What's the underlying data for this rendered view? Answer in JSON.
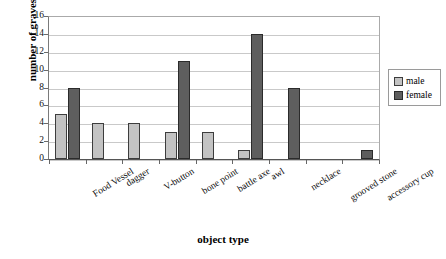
{
  "chart_data": {
    "type": "bar",
    "title": "",
    "xlabel": "object type",
    "ylabel": "number of graves",
    "ylim": [
      0,
      16
    ],
    "ytick_step": 2,
    "yticks": [
      16,
      14,
      12,
      10,
      8,
      6,
      4,
      2,
      0
    ],
    "grid": true,
    "legend_position": "right",
    "categories": [
      "Food Vessel",
      "dagger",
      "V-button",
      "bone point",
      "battle axe",
      "awl",
      "necklace",
      "grooved stone",
      "accessory cup"
    ],
    "series": [
      {
        "name": "male",
        "color": "#c3c3c3",
        "values": [
          5,
          4,
          4,
          3,
          3,
          1,
          0,
          0,
          0
        ]
      },
      {
        "name": "female",
        "color": "#5e5e5e",
        "values": [
          8,
          0,
          0,
          11,
          0,
          14,
          8,
          0,
          1
        ]
      }
    ]
  },
  "legend": {
    "entries": [
      {
        "label": "male"
      },
      {
        "label": "female"
      }
    ]
  },
  "axes": {
    "y_title": "number of graves",
    "x_title": "object type"
  }
}
